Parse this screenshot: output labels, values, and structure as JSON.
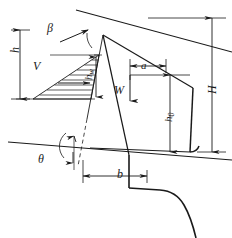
{
  "figure": {
    "type": "engineering-diagram",
    "background_color": "#ffffff",
    "line_color": "#1a1a1a",
    "labels": {
      "h": "h",
      "beta": "β",
      "V": "V",
      "hw_base": "h",
      "hw_sub": "w",
      "a": "a",
      "W": "W",
      "h0_base": "h",
      "h0_sub": "0",
      "H": "H",
      "theta": "θ",
      "b": "b"
    },
    "dimension_lines": [
      {
        "name": "h",
        "orientation": "vertical",
        "label": "h"
      },
      {
        "name": "hw",
        "orientation": "vertical",
        "label": "hw"
      },
      {
        "name": "a",
        "orientation": "horizontal",
        "label": "a"
      },
      {
        "name": "h0",
        "orientation": "vertical",
        "label": "h0"
      },
      {
        "name": "H",
        "orientation": "vertical",
        "label": "H"
      },
      {
        "name": "b",
        "orientation": "horizontal",
        "label": "b"
      }
    ],
    "angles": [
      {
        "name": "beta",
        "label": "β",
        "location": "top-left, between ground surface and failure plane"
      },
      {
        "name": "theta",
        "label": "θ",
        "location": "bottom-left, between ground line and horizontal"
      }
    ],
    "force_vectors": [
      {
        "name": "V",
        "label": "V",
        "direction": "horizontal",
        "description": "lateral pressure resultant in hatched triangular distribution"
      },
      {
        "name": "W",
        "label": "W",
        "direction": "downward",
        "description": "self weight of wall"
      }
    ]
  }
}
